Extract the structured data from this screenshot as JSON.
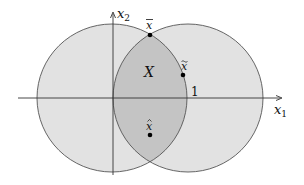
{
  "diagram": {
    "type": "set-intersection",
    "axes": {
      "x_label": "x",
      "x_sub": "1",
      "y_label": "x",
      "y_sub": "2",
      "tick_label": "1"
    },
    "region_label": "X",
    "points": [
      {
        "name": "x-bar",
        "label": "x",
        "accent": "‾"
      },
      {
        "name": "x-tilde",
        "label": "x",
        "accent": "~"
      },
      {
        "name": "x-hat",
        "label": "x",
        "accent": "^"
      }
    ],
    "colors": {
      "circle_fill": "#e2e2e2",
      "overlap_fill": "#c4c4c4",
      "stroke": "#555555",
      "axis": "#333333",
      "point": "#000000"
    }
  }
}
